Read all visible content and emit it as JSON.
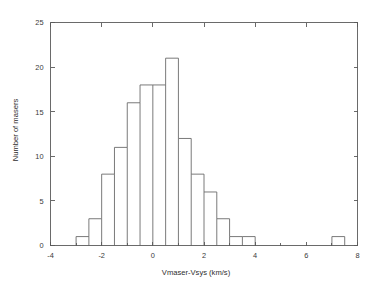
{
  "chart_data": {
    "type": "bar",
    "title": "",
    "xlabel": "Vmaser-Vsys (km/s)",
    "ylabel": "Number of masers",
    "xlim": [
      -4,
      8
    ],
    "ylim": [
      0,
      25
    ],
    "bin_width": 0.5,
    "grid": false,
    "legend": null,
    "xticks": [
      -4,
      -2,
      0,
      2,
      4,
      6,
      8
    ],
    "xtick_labels": [
      "-4",
      "-2",
      "0",
      "2",
      "4",
      "6",
      "8"
    ],
    "yticks": [
      0,
      5,
      10,
      15,
      20,
      25
    ],
    "ytick_labels": [
      "0",
      "5",
      "10",
      "15",
      "20",
      "25"
    ],
    "x_minor_ticks": [
      -3,
      -1,
      1,
      3,
      5,
      7
    ],
    "bin_edges": [
      -3.0,
      -2.5,
      -2.0,
      -1.5,
      -1.0,
      -0.5,
      0.0,
      0.5,
      1.0,
      1.5,
      2.0,
      2.5,
      3.0,
      3.5,
      4.0
    ],
    "bin_centers": [
      -2.75,
      -2.25,
      -1.75,
      -1.25,
      -0.75,
      -0.25,
      0.25,
      0.75,
      1.25,
      1.75,
      2.25,
      2.75,
      3.25,
      3.75
    ],
    "values": [
      1,
      3,
      8,
      11,
      16,
      18,
      18,
      21,
      12,
      8,
      6,
      3,
      1,
      1
    ],
    "outlier_bin": {
      "edges": [
        7.0,
        7.5
      ],
      "center": 7.25,
      "value": 1
    },
    "total_count": 109,
    "line_color": "#6b6b6b",
    "axis_color": "#5a5a5a",
    "background_color": "#ffffff"
  }
}
